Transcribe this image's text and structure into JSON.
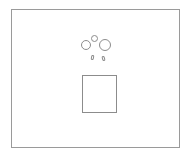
{
  "diagram": {
    "frame": {
      "label": "outer-frame",
      "stroke": "#9a9a9a"
    },
    "shapes": [
      {
        "type": "circle",
        "name": "left-circle",
        "x": 81,
        "y": 40,
        "size": 10
      },
      {
        "type": "circle",
        "name": "top-small-circle",
        "x": 91,
        "y": 35,
        "size": 7
      },
      {
        "type": "circle",
        "name": "right-circle",
        "x": 99,
        "y": 39,
        "size": 12
      },
      {
        "type": "capsule",
        "name": "left-leg",
        "x": 91,
        "y": 55,
        "w": 3,
        "h": 5
      },
      {
        "type": "capsule",
        "name": "right-leg",
        "x": 102,
        "y": 56,
        "w": 3,
        "h": 5
      },
      {
        "type": "square",
        "name": "square",
        "x": 82,
        "y": 75,
        "w": 35,
        "h": 38
      }
    ],
    "stroke_color": "#8c8c8c"
  }
}
